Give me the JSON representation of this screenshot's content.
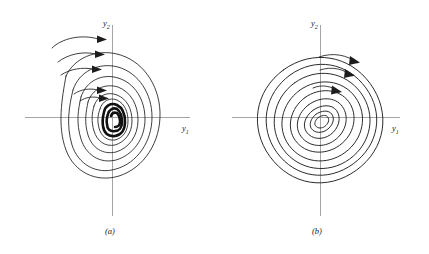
{
  "figure": {
    "background_color": "#ffffff",
    "ink_color": "#1d1d1d",
    "axis_color": "#9a9a9a",
    "width": 429,
    "height": 254
  },
  "panels": [
    {
      "id": "a",
      "caption": "(a)",
      "caption_x": 110,
      "caption_y": 233,
      "center_x": 112,
      "center_y": 117,
      "axis_tilt_deg": 8,
      "spiral_type": "stable-focus-inward",
      "turns": 3.1,
      "arrow_count": 5,
      "x_axis": {
        "label": "y",
        "subscript": "1",
        "x1": 25,
        "x2": 190,
        "y": 117,
        "label_x": 184,
        "label_y": 130
      },
      "y_axis": {
        "label": "y",
        "subscript": "2",
        "x": 112,
        "y1": 25,
        "y2": 216,
        "label_x": 105,
        "label_y": 24
      },
      "orbit_outer_rx": 48,
      "orbit_outer_ry": 62,
      "orbit_inner_rx": 10,
      "orbit_inner_ry": 13
    },
    {
      "id": "b",
      "caption": "(b)",
      "caption_x": 317,
      "caption_y": 233,
      "center_x": 320,
      "center_y": 120,
      "axis_tilt_deg": 36,
      "spiral_type": "stable-focus-inward-tilted",
      "turns": 3.4,
      "arrow_count": 3,
      "x_axis": {
        "label": "y",
        "subscript": "1",
        "x1": 232,
        "x2": 400,
        "y": 117,
        "label_x": 394,
        "label_y": 130
      },
      "y_axis": {
        "label": "y",
        "subscript": "2",
        "x": 320,
        "y1": 25,
        "y2": 216,
        "label_x": 313,
        "label_y": 24
      },
      "orbit_outer_rx": 60,
      "orbit_outer_ry": 38,
      "orbit_inner_rx": 8,
      "orbit_inner_ry": 5
    }
  ]
}
